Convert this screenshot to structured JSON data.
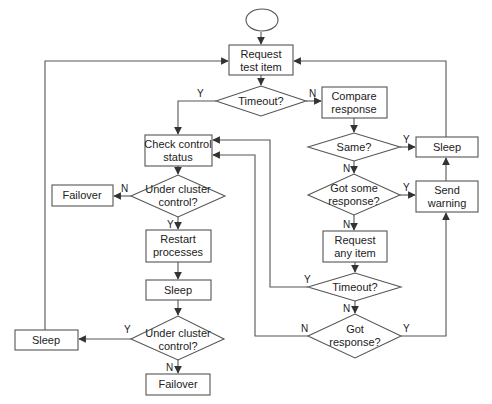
{
  "diagram": {
    "type": "flowchart",
    "colors": {
      "stroke": "#555555",
      "text": "#222222",
      "background": "#ffffff"
    },
    "nodes": {
      "start": {
        "shape": "oval",
        "label": ""
      },
      "request_test_item": {
        "shape": "box",
        "line1": "Request",
        "line2": "test item"
      },
      "timeout_1": {
        "shape": "diamond",
        "line1": "Timeout?"
      },
      "compare_response": {
        "shape": "box",
        "line1": "Compare",
        "line2": "response"
      },
      "check_control_status": {
        "shape": "box",
        "line1": "Check control",
        "line2": "status"
      },
      "same": {
        "shape": "diamond",
        "line1": "Same?"
      },
      "sleep_right": {
        "shape": "box",
        "line1": "Sleep"
      },
      "got_some_response": {
        "shape": "diamond",
        "line1": "Got some",
        "line2": "response?"
      },
      "send_warning": {
        "shape": "box",
        "line1": "Send",
        "line2": "warning"
      },
      "request_any_item": {
        "shape": "box",
        "line1": "Request",
        "line2": "any item"
      },
      "timeout_2": {
        "shape": "diamond",
        "line1": "Timeout?"
      },
      "got_response": {
        "shape": "diamond",
        "line1": "Got",
        "line2": "response?"
      },
      "under_cluster_control_1": {
        "shape": "diamond",
        "line1": "Under cluster",
        "line2": "control?"
      },
      "failover_1": {
        "shape": "box",
        "line1": "Failover"
      },
      "restart_processes": {
        "shape": "box",
        "line1": "Restart",
        "line2": "processes"
      },
      "sleep_middle": {
        "shape": "box",
        "line1": "Sleep"
      },
      "under_cluster_control_2": {
        "shape": "diamond",
        "line1": "Under cluster",
        "line2": "control?"
      },
      "sleep_left": {
        "shape": "box",
        "line1": "Sleep"
      },
      "failover_2": {
        "shape": "box",
        "line1": "Failover"
      }
    },
    "edge_labels": {
      "timeout_1_yes": "Y",
      "timeout_1_no": "N",
      "same_yes": "Y",
      "same_no": "N",
      "got_some_response_yes": "Y",
      "got_some_response_no": "N",
      "timeout_2_yes": "Y",
      "timeout_2_no": "N",
      "got_response_yes": "Y",
      "got_response_no": "N",
      "ucc_1_no": "N",
      "ucc_1_yes": "Y",
      "ucc_2_yes": "Y",
      "ucc_2_no": "N"
    },
    "edges": [
      {
        "from": "start",
        "to": "request_test_item"
      },
      {
        "from": "request_test_item",
        "to": "timeout_1"
      },
      {
        "from": "timeout_1",
        "to": "check_control_status",
        "label": "Y"
      },
      {
        "from": "timeout_1",
        "to": "compare_response",
        "label": "N"
      },
      {
        "from": "compare_response",
        "to": "same"
      },
      {
        "from": "same",
        "to": "sleep_right",
        "label": "Y"
      },
      {
        "from": "same",
        "to": "got_some_response",
        "label": "N"
      },
      {
        "from": "got_some_response",
        "to": "send_warning",
        "label": "Y"
      },
      {
        "from": "got_some_response",
        "to": "request_any_item",
        "label": "N"
      },
      {
        "from": "send_warning",
        "to": "sleep_right"
      },
      {
        "from": "sleep_right",
        "to": "request_test_item"
      },
      {
        "from": "request_any_item",
        "to": "timeout_2"
      },
      {
        "from": "timeout_2",
        "to": "check_control_status",
        "label": "Y"
      },
      {
        "from": "timeout_2",
        "to": "got_response",
        "label": "N"
      },
      {
        "from": "got_response",
        "to": "check_control_status",
        "label": "N"
      },
      {
        "from": "got_response",
        "to": "send_warning",
        "label": "Y"
      },
      {
        "from": "check_control_status",
        "to": "under_cluster_control_1"
      },
      {
        "from": "under_cluster_control_1",
        "to": "failover_1",
        "label": "N"
      },
      {
        "from": "under_cluster_control_1",
        "to": "restart_processes",
        "label": "Y"
      },
      {
        "from": "restart_processes",
        "to": "sleep_middle"
      },
      {
        "from": "sleep_middle",
        "to": "under_cluster_control_2"
      },
      {
        "from": "under_cluster_control_2",
        "to": "sleep_left",
        "label": "Y"
      },
      {
        "from": "under_cluster_control_2",
        "to": "failover_2",
        "label": "N"
      },
      {
        "from": "sleep_left",
        "to": "request_test_item"
      }
    ]
  }
}
